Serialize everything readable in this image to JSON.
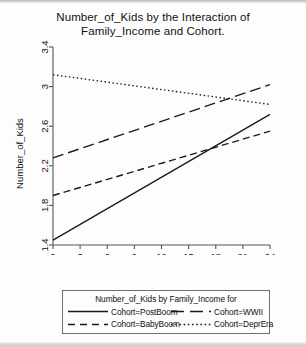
{
  "chart_data": {
    "type": "line",
    "title": "Number_of_Kids by the Interaction of Family_Income and Cohort.",
    "title_line1": "Number_of_Kids by the Interaction of",
    "title_line2": "Family_Income and Cohort.",
    "xlabel": "Family_Income",
    "ylabel": "Number_of_Kids",
    "xlim": [
      0,
      24
    ],
    "ylim": [
      1.4,
      3.4
    ],
    "xticks": [
      0,
      3,
      6,
      9,
      12,
      15,
      18,
      21,
      24
    ],
    "yticks": [
      1.4,
      1.8,
      2.2,
      2.6,
      3,
      3.4
    ],
    "ytick_labels": [
      "1.4",
      "1.8",
      "2.2",
      "2.6",
      "3",
      "3.4"
    ],
    "xtick_labels": [
      "0",
      "3",
      "6",
      "9",
      "12",
      "15",
      "18",
      "21",
      "24"
    ],
    "grid": false,
    "legend_position": "bottom",
    "legend_title": "Number_of_Kids by Family_Income for",
    "line_color": "#1a1a1a",
    "series": [
      {
        "name": "Cohort=PostBoom",
        "style": "solid",
        "dasharray": "",
        "x": [
          0,
          24
        ],
        "values": [
          1.45,
          2.72
        ]
      },
      {
        "name": "Cohort=WWII",
        "style": "long-dash",
        "dasharray": "11,5",
        "x": [
          0,
          24
        ],
        "values": [
          2.28,
          3.02
        ]
      },
      {
        "name": "Cohort=BabyBoom",
        "style": "dashed",
        "dasharray": "7,4",
        "x": [
          0,
          24
        ],
        "values": [
          1.9,
          2.55
        ]
      },
      {
        "name": "Cohort=DeprEra",
        "style": "dotted",
        "dasharray": "1.5,2.5",
        "x": [
          0,
          24
        ],
        "values": [
          3.12,
          2.82
        ]
      }
    ]
  },
  "legend": {
    "title": "Number_of_Kids by Family_Income for",
    "entries": [
      {
        "label": "Cohort=PostBoom",
        "style": "solid"
      },
      {
        "label": "Cohort=WWII",
        "style": "long-dash"
      },
      {
        "label": "Cohort=BabyBoom",
        "style": "dashed"
      },
      {
        "label": "Cohort=DeprEra",
        "style": "dotted"
      }
    ]
  }
}
